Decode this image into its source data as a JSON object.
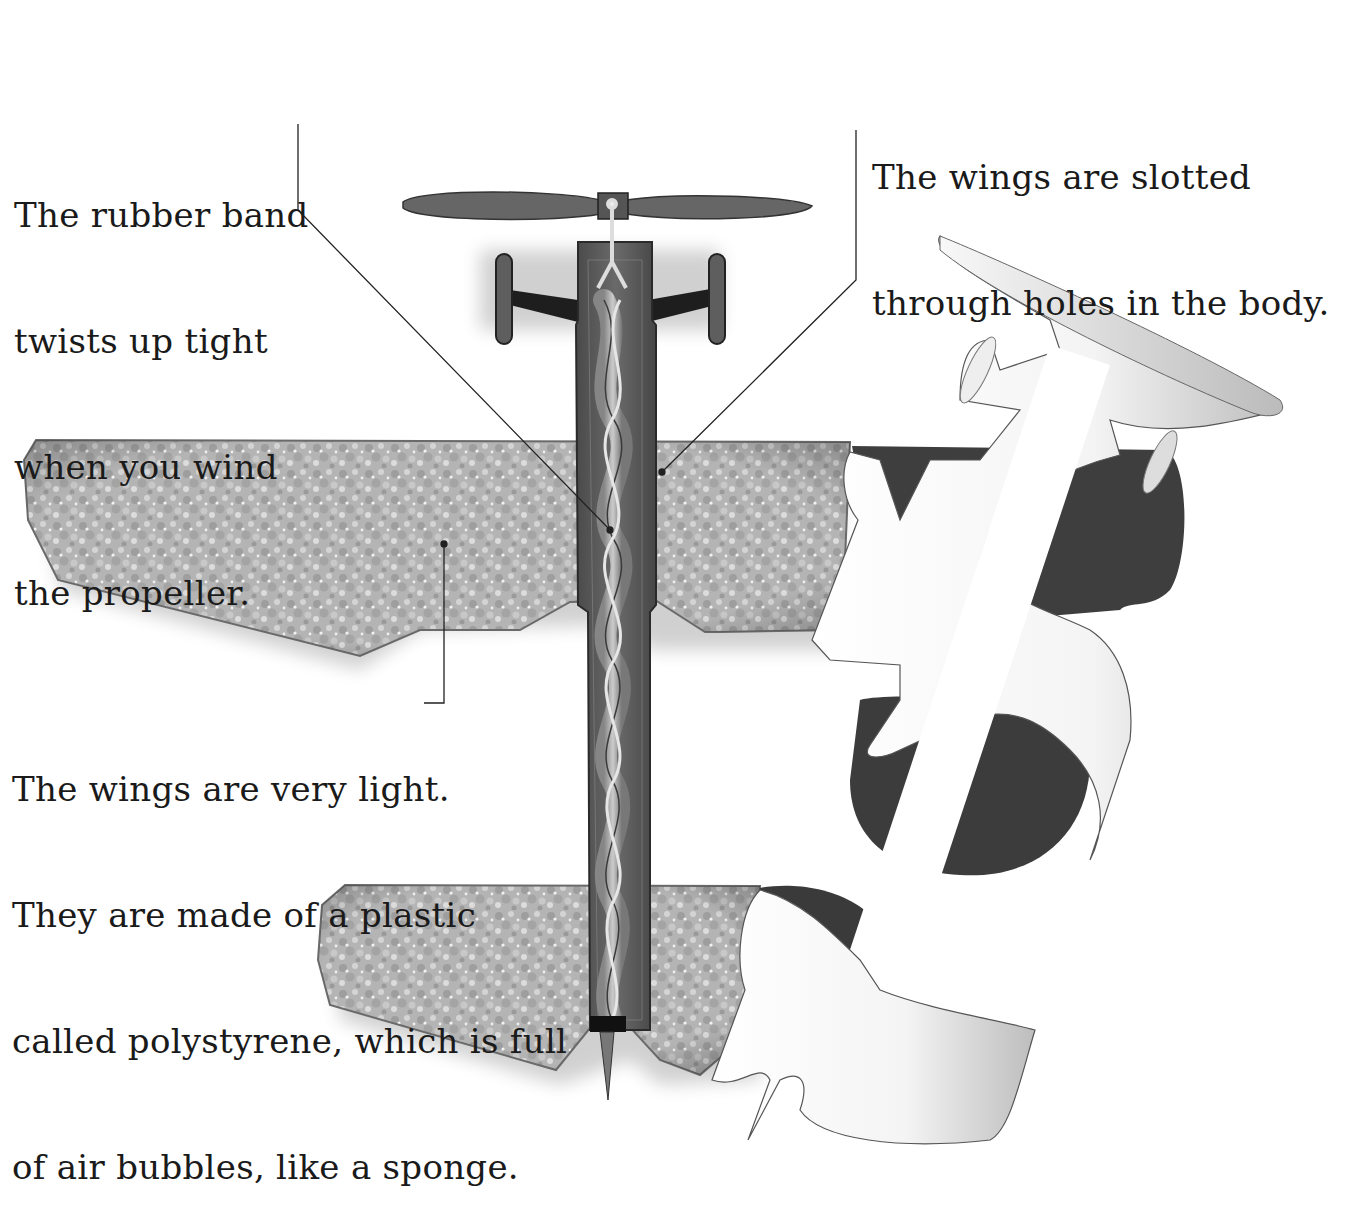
{
  "diagram": {
    "annotations": [
      {
        "id": "rubber-band",
        "lines": [
          "The rubber band",
          "twists up tight",
          "when you wind",
          "the propeller."
        ]
      },
      {
        "id": "wings-slotted",
        "lines": [
          "The wings are slotted",
          "through holes in the body."
        ]
      },
      {
        "id": "wings-light",
        "lines": [
          "The wings are very light.",
          "They are made of a plastic",
          "called polystyrene, which is full",
          "of air bubbles, like a sponge."
        ]
      }
    ],
    "parts": [
      "propeller",
      "propeller-hook",
      "landing-gear",
      "wheel-left",
      "wheel-right",
      "fuselage",
      "twisted-rubber-band",
      "main-wing",
      "tail-wing",
      "tail-fin",
      "peel-away-cutout"
    ],
    "colors": {
      "background": "#ffffff",
      "text": "#1a1a1a",
      "foam": "#b8b8b8",
      "foam_dark": "#8c8c8c",
      "fuselage": "#5a5a5a",
      "propeller": "#666666",
      "shadow_part": "#4a4a4a",
      "leader_line": "#222222"
    }
  }
}
